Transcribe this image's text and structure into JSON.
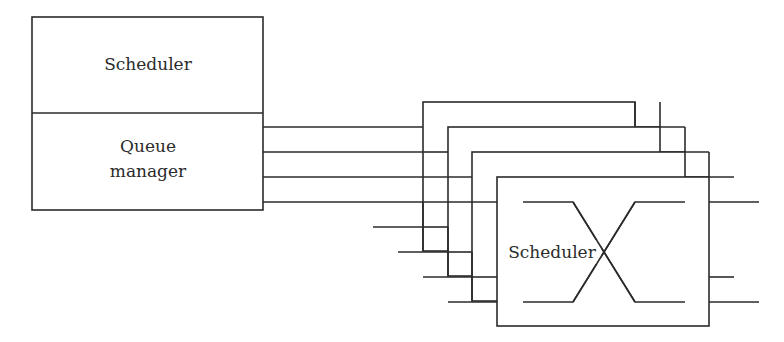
{
  "diagram": {
    "left_block": {
      "top_label": "Scheduler",
      "bottom_label_line1": "Queue",
      "bottom_label_line2": "manager"
    },
    "switch_stack": {
      "count": 4,
      "front_label": "Scheduler",
      "front_symbol": "crossbar-x"
    },
    "colors": {
      "line": "#2b2b2b",
      "background": "#ffffff"
    }
  }
}
